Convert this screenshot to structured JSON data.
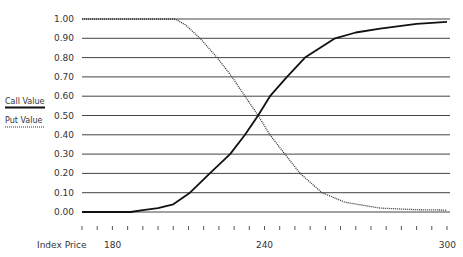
{
  "chart_data": {
    "type": "line",
    "title": "",
    "xlabel": "Index Price",
    "ylabel": "",
    "xlim": [
      180,
      300
    ],
    "ylim": [
      0,
      1
    ],
    "grid": "horizontal",
    "legend_position": "left",
    "y_ticks": [
      "0.00",
      "0.10",
      "0.20",
      "0.30",
      "0.40",
      "0.50",
      "0.60",
      "0.70",
      "0.80",
      "0.90",
      "1.00"
    ],
    "y_tick_values": [
      0,
      0.1,
      0.2,
      0.3,
      0.4,
      0.5,
      0.6,
      0.7,
      0.8,
      0.9,
      1.0
    ],
    "x_tick_labels": [
      {
        "value": 180,
        "label": "180"
      },
      {
        "value": 240,
        "label": "240"
      },
      {
        "value": 300,
        "label": "300"
      }
    ],
    "x_minor_tick_step": 5,
    "series": [
      {
        "name": "Call Value",
        "style": "solid",
        "color": "#111111",
        "x": [
          180,
          196,
          200,
          205,
          210,
          215.5,
          222,
          228.7,
          233.6,
          237.9,
          241.8,
          247.4,
          253.3,
          263.2,
          270,
          278,
          290,
          300
        ],
        "y": [
          0.0,
          0.0,
          0.01,
          0.02,
          0.04,
          0.1,
          0.2,
          0.3,
          0.4,
          0.5,
          0.6,
          0.7,
          0.8,
          0.9,
          0.93,
          0.95,
          0.975,
          0.985
        ]
      },
      {
        "name": "Put Value",
        "style": "dotted",
        "color": "#333333",
        "x": [
          180,
          205,
          210.6,
          214,
          218.8,
          224.4,
          229.3,
          233.6,
          237.9,
          241.8,
          246.7,
          251.7,
          258.9,
          266.5,
          278,
          290,
          300
        ],
        "y": [
          1.0,
          1.0,
          1.0,
          0.97,
          0.9,
          0.8,
          0.7,
          0.6,
          0.5,
          0.4,
          0.3,
          0.2,
          0.1,
          0.05,
          0.02,
          0.012,
          0.01
        ]
      }
    ]
  },
  "axis": {
    "x_title": "Index Price"
  },
  "legend": [
    {
      "label": "Call Value",
      "style": "solid"
    },
    {
      "label": "Put Value",
      "style": "dotted"
    }
  ]
}
